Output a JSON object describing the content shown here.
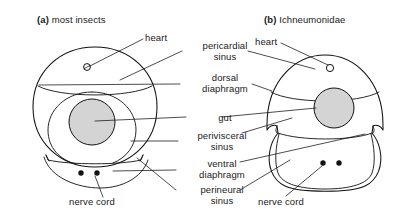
{
  "figure": {
    "type": "biological-diagram",
    "panels": [
      {
        "id": "a",
        "prefix": "(a)",
        "title": "most insects",
        "shape": "round cross-section",
        "features": [
          "heart",
          "pericardial sinus",
          "dorsal diaphragm",
          "gut",
          "perivisceral sinus",
          "ventral diaphragm",
          "perineural sinus",
          "nerve cord"
        ]
      },
      {
        "id": "b",
        "prefix": "(b)",
        "title": "Ichneumonidae",
        "shape": "dome cross-section with lobed ventral region",
        "features": [
          "heart",
          "pericardial sinus",
          "dorsal diaphragm",
          "gut",
          "perivisceral sinus",
          "ventral diaphragm",
          "perineural sinus",
          "nerve cord"
        ]
      }
    ]
  },
  "labels": {
    "panel_a_caption_prefix": "(a)",
    "panel_a_caption_text": "most insects",
    "panel_b_caption_prefix": "(b)",
    "panel_b_caption_text": "Ichneumonidae",
    "heart_left": "heart",
    "heart_right": "heart",
    "pericardial_line1": "pericardial",
    "pericardial_line2": "sinus",
    "dorsal_line1": "dorsal",
    "dorsal_line2": "diaphragm",
    "gut": "gut",
    "perivisceral_line1": "perivisceral",
    "perivisceral_line2": "sinus",
    "ventral_line1": "ventral",
    "ventral_line2": "diaphragm",
    "perineural_line1": "perineural",
    "perineural_line2": "sinus",
    "nerve_cord_left": "nerve cord",
    "nerve_cord_right": "nerve cord"
  },
  "colors": {
    "background": "#ffffff",
    "ink": "#111111",
    "text": "#1a1a1a",
    "gut_fill": "#d4d4d4"
  }
}
